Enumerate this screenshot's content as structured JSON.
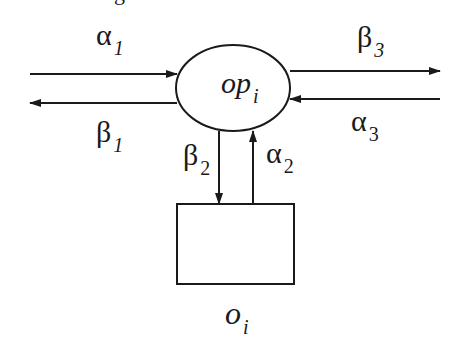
{
  "diagram": {
    "top_partial_text": "g",
    "operator_node": {
      "label": "op",
      "subscript": "i"
    },
    "object_node": {
      "label": "o",
      "subscript": "i"
    },
    "edges": [
      {
        "id": "alpha1",
        "symbol": "α",
        "subscript": "1",
        "direction": "into op_i from left"
      },
      {
        "id": "beta1",
        "symbol": "β",
        "subscript": "1",
        "direction": "out of op_i to left"
      },
      {
        "id": "beta3",
        "symbol": "β",
        "subscript": "3",
        "direction": "out of op_i to right"
      },
      {
        "id": "alpha3",
        "symbol": "α",
        "subscript": "3",
        "direction": "into op_i from right"
      },
      {
        "id": "beta2",
        "symbol": "β",
        "subscript": "2",
        "direction": "from op_i down to o_i"
      },
      {
        "id": "alpha2",
        "symbol": "α",
        "subscript": "2",
        "direction": "from o_i up to op_i"
      }
    ],
    "stroke_color": "#1a1a1a",
    "background": "#ffffff"
  }
}
